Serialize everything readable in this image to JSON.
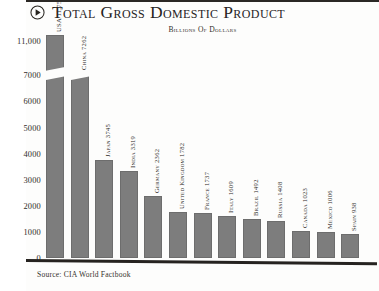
{
  "header": {
    "bullet_icon": "circled-play-icon",
    "title": "Total Gross Domestic Product",
    "subtitle": "Billions of Dollars"
  },
  "source": {
    "text": "Source: CIA World Factbook"
  },
  "chart_data": {
    "type": "bar",
    "title": "Total Gross Domestic Product",
    "subtitle": "Billions of Dollars",
    "xlabel": "",
    "ylabel": "Billions of Dollars",
    "ylim": [
      0,
      11000
    ],
    "grid": false,
    "axis_break": {
      "between": [
        7000,
        11000
      ],
      "note": "y-axis compressed above 7000"
    },
    "legend": "none",
    "ytick_labels": [
      "11,000",
      "7000",
      "6000",
      "5000",
      "4000",
      "3000",
      "2000",
      "1000",
      "0"
    ],
    "ytick_values": [
      11000,
      7000,
      6000,
      5000,
      4000,
      3000,
      2000,
      1000,
      0
    ],
    "categories": [
      "USA",
      "China",
      "Japan",
      "India",
      "Germany",
      "United Kingdom",
      "France",
      "Italy",
      "Brazil",
      "Russia",
      "Canada",
      "Mexico",
      "Spain"
    ],
    "values": [
      11750,
      7262,
      3745,
      3319,
      2362,
      1782,
      1737,
      1609,
      1492,
      1408,
      1023,
      1006,
      938
    ],
    "bar_labels": [
      "USA 11,750",
      "China 7262",
      "Japan 3745",
      "India 3319",
      "Germany 2362",
      "United Kingdom 1782",
      "France 1737",
      "Italy 1609",
      "Brazil 1492",
      "Russia 1408",
      "Canada 1023",
      "Mexico 1006",
      "Spain 938"
    ],
    "bar_color": "#7d7d7d"
  }
}
